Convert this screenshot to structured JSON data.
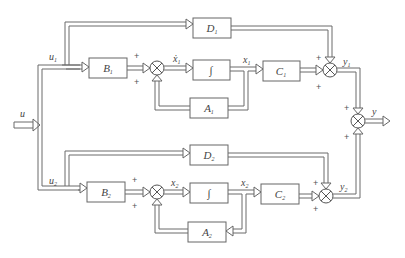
{
  "diagram": {
    "title": "",
    "input": {
      "label": "u"
    },
    "output": {
      "label": "y"
    },
    "subsystem1": {
      "input_label": "u",
      "input_sub": "1",
      "blocks": {
        "B": {
          "label": "B",
          "sub": "1"
        },
        "D": {
          "label": "D",
          "sub": "1"
        },
        "integrator": {
          "label": "∫"
        },
        "A": {
          "label": "A",
          "sub": "1"
        },
        "C": {
          "label": "C",
          "sub": "1"
        }
      },
      "state_dot_label": "ẋ",
      "state_dot_sub": "1",
      "state_label": "x",
      "state_sub": "1",
      "output_label": "y",
      "output_sub": "1"
    },
    "subsystem2": {
      "input_label": "u",
      "input_sub": "2",
      "blocks": {
        "B": {
          "label": "B",
          "sub": "2"
        },
        "D": {
          "label": "D",
          "sub": "2"
        },
        "integrator": {
          "label": "∫"
        },
        "A": {
          "label": "A",
          "sub": "2"
        },
        "C": {
          "label": "C",
          "sub": "2"
        }
      },
      "state_dot_label": "ẋ",
      "state_dot_sub": "2",
      "state_label": "x",
      "state_sub": "2",
      "output_label": "y",
      "output_sub": "2"
    },
    "signs": {
      "plus": "+"
    }
  }
}
